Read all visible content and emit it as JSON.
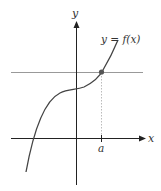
{
  "diagram": {
    "axes": {
      "x_label": "x",
      "y_label": "y"
    },
    "curve_label": "y = f(x)",
    "point_label": "a",
    "colors": {
      "axis": "#222222",
      "curve": "#444444",
      "horizontal_line": "#999999",
      "point": "#555555",
      "dashed": "#aaaaaa"
    }
  }
}
